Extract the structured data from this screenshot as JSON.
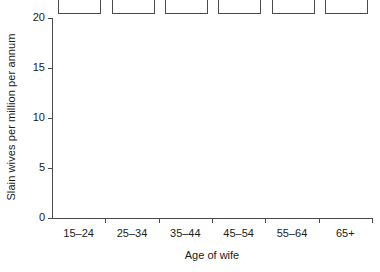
{
  "chart_data": {
    "type": "bar",
    "title": "",
    "subtitle": "",
    "xlabel": "Age of wife",
    "ylabel": "Slain wives per million per annum",
    "categories": [
      "15–24",
      "25–34",
      "35–44",
      "45–54",
      "55–64",
      "65+"
    ],
    "values": [
      18.9,
      12.3,
      11.4,
      9.0,
      7.5,
      7.6
    ],
    "ylim": [
      0,
      20
    ],
    "yticks": [
      0,
      5,
      10,
      15,
      20
    ],
    "ytick_labels": [
      "0",
      "5",
      "10",
      "15",
      "20"
    ],
    "grid": false,
    "legend": null,
    "legend_position": "none",
    "bar_fill_color": "#ffffff",
    "bar_edge_color": "#4a4a4a",
    "axis_color": "#4a4a4a",
    "background_color": "#ffffff",
    "text_color": "#1a1a1a"
  }
}
